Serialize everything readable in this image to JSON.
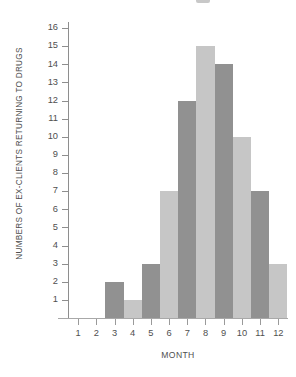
{
  "chart_data": {
    "type": "bar",
    "title": "",
    "xlabel": "MONTH",
    "ylabel": "NUMBERS OF EX-CLIENTS RETURNING TO DRUGS",
    "categories": [
      "1",
      "2",
      "3",
      "4",
      "5",
      "6",
      "7",
      "8",
      "9",
      "10",
      "11",
      "12"
    ],
    "values": [
      0,
      0,
      2,
      1,
      3,
      7,
      12,
      15,
      14,
      10,
      7,
      3
    ],
    "ytick_labels": [
      "1",
      "2",
      "3",
      "4",
      "5",
      "6",
      "7",
      "8",
      "9",
      "10",
      "11",
      "12",
      "13",
      "14",
      "15",
      "16"
    ],
    "ylim": [
      0,
      16
    ],
    "grid": false,
    "legend": "none",
    "bar_colors": [
      "#c6c6c6",
      "#919191",
      "#919191",
      "#c6c6c6",
      "#919191",
      "#c6c6c6",
      "#919191",
      "#c6c6c6",
      "#919191",
      "#c6c6c6",
      "#919191",
      "#c6c6c6"
    ]
  },
  "colors": {
    "bar_dark": "#919191",
    "bar_light": "#c6c6c6",
    "axis": "#8e8e8e",
    "text": "#4f4f4f",
    "background": "#ffffff"
  }
}
